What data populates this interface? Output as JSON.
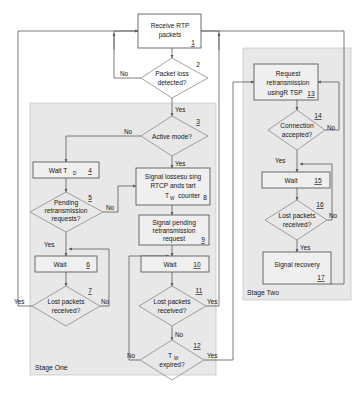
{
  "diagram": {
    "title_present": false,
    "type": "flowchart",
    "stages": [
      {
        "id": "stage-one",
        "label": "Stage One"
      },
      {
        "id": "stage-two",
        "label": "Stage Two"
      }
    ],
    "nodes": [
      {
        "id": "n1",
        "num": "1",
        "shape": "process",
        "lines": [
          "Receive RTP",
          "packets"
        ]
      },
      {
        "id": "n2",
        "num": "2",
        "shape": "decision",
        "lines": [
          "Packet loss",
          "detected?"
        ]
      },
      {
        "id": "n3",
        "num": "3",
        "shape": "decision",
        "lines": [
          "Active mode?"
        ]
      },
      {
        "id": "n4",
        "num": "4",
        "shape": "process",
        "lines": [
          "Wait T"
        ],
        "sub": "D"
      },
      {
        "id": "n5",
        "num": "5",
        "shape": "decision",
        "lines": [
          "Pending",
          "retransmission",
          "requests?"
        ]
      },
      {
        "id": "n6",
        "num": "6",
        "shape": "process",
        "lines": [
          "Wait"
        ]
      },
      {
        "id": "n7",
        "num": "7",
        "shape": "decision",
        "lines": [
          "Lost packets",
          "received?"
        ]
      },
      {
        "id": "n8",
        "num": "8",
        "shape": "process",
        "lines": [
          "Signal lossesu sing",
          "RTCP ands tart",
          "T",
          "counter"
        ],
        "sub": "W"
      },
      {
        "id": "n9",
        "num": "9",
        "shape": "process",
        "lines": [
          "Signal pending",
          "retransmission",
          "request"
        ]
      },
      {
        "id": "n10",
        "num": "10",
        "shape": "process",
        "lines": [
          "Wait"
        ]
      },
      {
        "id": "n11",
        "num": "11",
        "shape": "decision",
        "lines": [
          "Lost packets",
          "received?"
        ]
      },
      {
        "id": "n12",
        "num": "12",
        "shape": "decision",
        "lines": [
          "T",
          "expired?"
        ],
        "sub": "W"
      },
      {
        "id": "n13",
        "num": "13",
        "shape": "process",
        "lines": [
          "Request",
          "retransmission",
          "usingR TSP"
        ]
      },
      {
        "id": "n14",
        "num": "14",
        "shape": "decision",
        "lines": [
          "Connection",
          "accepted?"
        ]
      },
      {
        "id": "n15",
        "num": "15",
        "shape": "process",
        "lines": [
          "Wait"
        ]
      },
      {
        "id": "n16",
        "num": "16",
        "shape": "decision",
        "lines": [
          "Lost packets",
          "received?"
        ]
      },
      {
        "id": "n17",
        "num": "17",
        "shape": "process",
        "lines": [
          "Signal recovery"
        ]
      }
    ],
    "edge_labels": {
      "e2_no": "No",
      "e2_yes": "Yes",
      "e3_no": "No",
      "e3_yes": "Yes",
      "e5_no": "No",
      "e5_yes": "Yes",
      "e7_yes": "Yes",
      "e7_no": "No",
      "e11_yes": "Yes",
      "e11_no": "No",
      "e12_no": "No",
      "e12_yes": "Yes",
      "e14_no": "No",
      "e14_yes": "Yes",
      "e16_no": "No",
      "e16_yes": "Yes"
    },
    "text": {
      "n1_l1": "Receive RTP",
      "n1_l2": "packets",
      "n1_num": "1",
      "n2_l1": "Packet loss",
      "n2_l2": "detected?",
      "n2_num": "2",
      "n3_l1": "Active mode?",
      "n3_num": "3",
      "n4_l1": "Wait T",
      "n4_sub": "D",
      "n4_num": "4",
      "n5_l1": "Pending",
      "n5_l2": "retransmission",
      "n5_l3": "requests?",
      "n5_num": "5",
      "n6_l1": "Wait",
      "n6_num": "6",
      "n7_l1": "Lost packets",
      "n7_l2": "received?",
      "n7_num": "7",
      "n8_l1": "Signal lossesu sing",
      "n8_l2": "RTCP ands tart",
      "n8_l3": "T",
      "n8_sub": "W",
      "n8_l4": "counter",
      "n8_num": "8",
      "n9_l1": "Signal pending",
      "n9_l2": "retransmission",
      "n9_l3": "request",
      "n9_num": "9",
      "n10_l1": "Wait",
      "n10_num": "10",
      "n11_l1": "Lost packets",
      "n11_l2": "received?",
      "n11_num": "11",
      "n12_l1": "T",
      "n12_sub": "W",
      "n12_l2": "expired?",
      "n12_num": "12",
      "n13_l1": "Request",
      "n13_l2": "retransmission",
      "n13_l3": "usingR TSP",
      "n13_num": "13",
      "n14_l1": "Connection",
      "n14_l2": "accepted?",
      "n14_num": "14",
      "n15_l1": "Wait",
      "n15_num": "15",
      "n16_l1": "Lost packets",
      "n16_l2": "received?",
      "n16_num": "16",
      "n17_l1": "Signal recovery",
      "n17_num": "17",
      "stage_one": "Stage One",
      "stage_two": "Stage Two"
    },
    "colors": {
      "panel_fill": "#e8e8e8",
      "box_stroke": "#4a4a4a",
      "line": "#5a5a5a",
      "text": "#161616",
      "page_bg": "#ffffff"
    }
  }
}
